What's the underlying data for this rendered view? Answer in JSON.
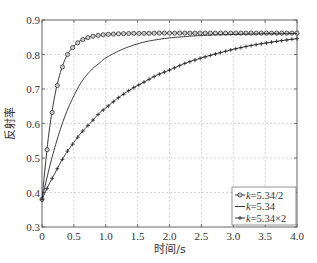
{
  "chart_data": {
    "type": "line",
    "title": "",
    "xlabel": "时间/s",
    "ylabel": "反射率",
    "xlim": [
      0,
      4.0
    ],
    "ylim": [
      0.3,
      0.9
    ],
    "xticks": [
      0,
      0.5,
      1.0,
      1.5,
      2.0,
      2.5,
      3.0,
      3.5,
      4.0
    ],
    "xtick_labels": [
      "0",
      "0.5",
      "1.0",
      "1.5",
      "2.0",
      "2.5",
      "3.0",
      "3.5",
      "4.0"
    ],
    "yticks": [
      0.3,
      0.4,
      0.5,
      0.6,
      0.7,
      0.8,
      0.9
    ],
    "ytick_labels": [
      "0.3",
      "0.4",
      "0.5",
      "0.6",
      "0.7",
      "0.8",
      "0.9"
    ],
    "grid": true,
    "legend_position": "lower right",
    "x": [
      0,
      0.1,
      0.2,
      0.3,
      0.4,
      0.5,
      0.6,
      0.7,
      0.8,
      0.9,
      1.0,
      1.2,
      1.4,
      1.6,
      1.8,
      2.0,
      2.25,
      2.5,
      2.75,
      3.0,
      3.25,
      3.5,
      3.75,
      4.0
    ],
    "series": [
      {
        "name": "k=5.34/2",
        "marker": "circle",
        "values": [
          0.38,
          0.56,
          0.68,
          0.755,
          0.8,
          0.825,
          0.84,
          0.848,
          0.853,
          0.856,
          0.858,
          0.86,
          0.861,
          0.861,
          0.862,
          0.862,
          0.862,
          0.862,
          0.862,
          0.862,
          0.862,
          0.862,
          0.862,
          0.862
        ]
      },
      {
        "name": "k=5.34",
        "marker": "none",
        "values": [
          0.38,
          0.46,
          0.53,
          0.59,
          0.64,
          0.68,
          0.715,
          0.74,
          0.76,
          0.775,
          0.79,
          0.81,
          0.825,
          0.836,
          0.843,
          0.848,
          0.852,
          0.855,
          0.857,
          0.858,
          0.859,
          0.86,
          0.86,
          0.861
        ]
      },
      {
        "name": "k=5.34×2",
        "marker": "plus",
        "values": [
          0.38,
          0.42,
          0.455,
          0.49,
          0.52,
          0.545,
          0.57,
          0.59,
          0.61,
          0.63,
          0.645,
          0.675,
          0.7,
          0.72,
          0.74,
          0.755,
          0.775,
          0.79,
          0.803,
          0.815,
          0.825,
          0.833,
          0.84,
          0.846
        ]
      }
    ]
  },
  "legend": {
    "items": [
      {
        "prefix": "k",
        "suffix": "=5.34/2"
      },
      {
        "prefix": "k",
        "suffix": "=5.34"
      },
      {
        "prefix": "k",
        "suffix": "=5.34×2"
      }
    ]
  },
  "colors": {
    "line": "#222222",
    "grid": "#bbbbbb",
    "marker_fill": "#cccccc"
  }
}
